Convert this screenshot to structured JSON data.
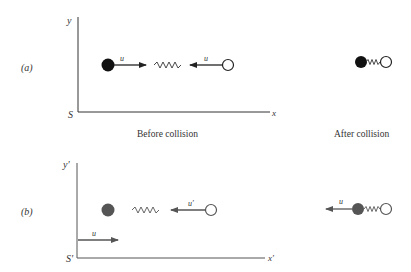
{
  "panel_a": {
    "label": "(a)",
    "axis_y": "y",
    "axis_x": "x",
    "origin": "S",
    "velocity_left": "u",
    "velocity_right": "u",
    "caption_before": "Before collision",
    "caption_after": "After collision"
  },
  "panel_b": {
    "label": "(b)",
    "axis_y": "y′",
    "axis_x": "x′",
    "origin": "S′",
    "frame_velocity": "u",
    "velocity_right": "u′",
    "velocity_after": "u"
  },
  "colors": {
    "ball_a": "#111111",
    "ball_b": "#555555",
    "axis": "#444444"
  }
}
